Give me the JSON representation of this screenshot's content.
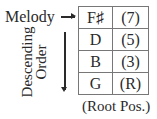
{
  "melody_label": "Melody",
  "axis_label_line1": "Descending",
  "axis_label_line2": "Order",
  "rows": [
    {
      "note": "F♯",
      "interval": "(7)"
    },
    {
      "note": "D",
      "interval": "(5)"
    },
    {
      "note": "B",
      "interval": "(3)"
    },
    {
      "note": "G",
      "interval": "(R)"
    }
  ],
  "caption": "(Root Pos.)"
}
